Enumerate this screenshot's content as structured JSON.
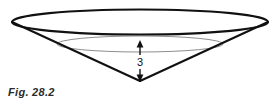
{
  "figure": {
    "caption": "Fig. 28.2",
    "dimension_label": "3",
    "colors": {
      "background": "#ffffff",
      "outline": "#111111",
      "inner_ellipse": "#8d8d8d",
      "caption_text": "#2b2b2b",
      "arrow": "#111111"
    },
    "geometry": {
      "top_rim_ellipse": {
        "cx": 140,
        "cy": 22,
        "rx": 128,
        "ry": 13
      },
      "inner_ellipse": {
        "cx": 140,
        "cy": 44,
        "rx": 83,
        "ry": 8
      },
      "apex": {
        "x": 140,
        "y": 81
      },
      "left_rim_point": {
        "x": 12,
        "y": 22
      },
      "right_rim_point": {
        "x": 268,
        "y": 22
      },
      "dimension_arrow": {
        "x": 140,
        "y_top": 41,
        "y_bottom": 81
      }
    }
  }
}
